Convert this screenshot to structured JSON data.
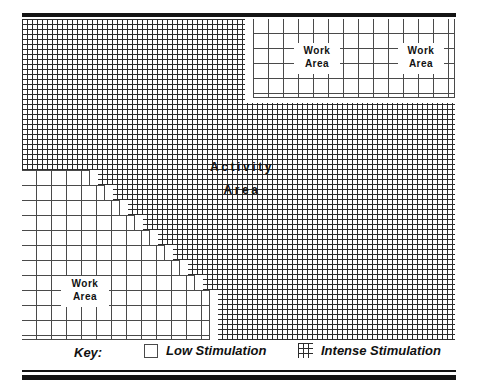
{
  "figure": {
    "plan_labels": {
      "activity_area_line1": "Activity",
      "activity_area_line2": "Area",
      "work_area_line1": "Work",
      "work_area_line2": "Area"
    },
    "regions": [
      {
        "name": "work-area-top-left",
        "label_line1": "Work",
        "label_line2": "Area",
        "stimulation": "Low Stimulation"
      },
      {
        "name": "work-area-top-right",
        "label_line1": "Work",
        "label_line2": "Area",
        "stimulation": "Low Stimulation"
      },
      {
        "name": "work-area-bottom-left",
        "label_line1": "Work",
        "label_line2": "Area",
        "stimulation": "Low Stimulation"
      },
      {
        "name": "activity-area",
        "label_line1": "Activity",
        "label_line2": "Area",
        "stimulation": "Intense Stimulation"
      }
    ]
  },
  "key": {
    "title": "Key:",
    "entries": [
      {
        "icon": "low-stimulation-swatch",
        "label": "Low Stimulation"
      },
      {
        "icon": "intense-stimulation-swatch",
        "label": "Intense Stimulation"
      }
    ]
  },
  "colors": {
    "frame": "#141414",
    "fine_grid_line": "#2b2b2b",
    "coarse_grid_line": "#4a4a4a",
    "background": "#ffffff",
    "text": "#111111"
  }
}
